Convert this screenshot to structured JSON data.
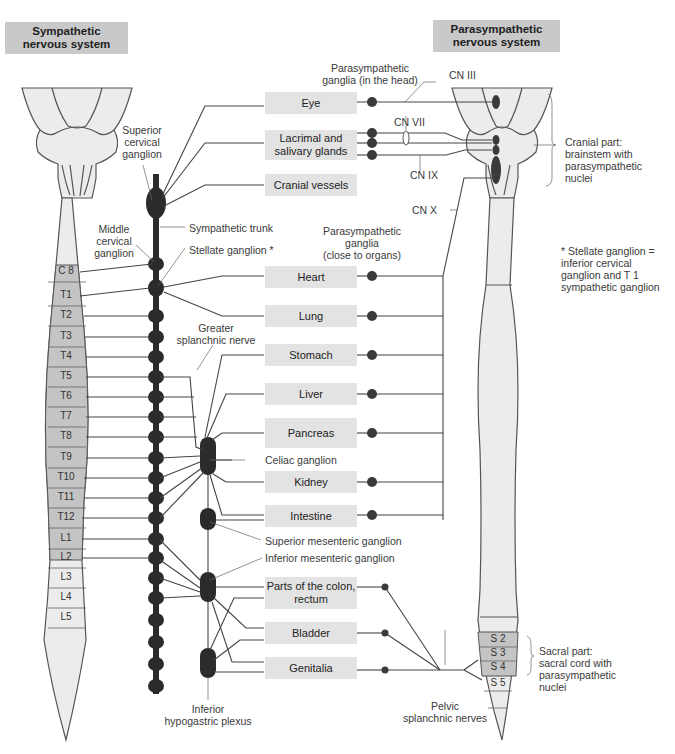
{
  "headers": {
    "sympathetic": [
      "Sympathetic",
      "nervous system"
    ],
    "parasympathetic": [
      "Parasympathetic",
      "nervous system"
    ]
  },
  "organs": [
    {
      "id": "eye",
      "lines": [
        "Eye"
      ]
    },
    {
      "id": "lacrimal",
      "lines": [
        "Lacrimal and",
        "salivary glands"
      ]
    },
    {
      "id": "cranial-vessels",
      "lines": [
        "Cranial vessels"
      ]
    },
    {
      "id": "heart",
      "lines": [
        "Heart"
      ]
    },
    {
      "id": "lung",
      "lines": [
        "Lung"
      ]
    },
    {
      "id": "stomach",
      "lines": [
        "Stomach"
      ]
    },
    {
      "id": "liver",
      "lines": [
        "Liver"
      ]
    },
    {
      "id": "pancreas",
      "lines": [
        "Pancreas"
      ]
    },
    {
      "id": "kidney",
      "lines": [
        "Kidney"
      ]
    },
    {
      "id": "intestine",
      "lines": [
        "Intestine"
      ]
    },
    {
      "id": "colon",
      "lines": [
        "Parts of the colon,",
        "rectum"
      ]
    },
    {
      "id": "bladder",
      "lines": [
        "Bladder"
      ]
    },
    {
      "id": "genitalia",
      "lines": [
        "Genitalia"
      ]
    }
  ],
  "spinal_segments_left": [
    "C 8",
    "T1",
    "T2",
    "T3",
    "T4",
    "T5",
    "T6",
    "T7",
    "T8",
    "T9",
    "T10",
    "T11",
    "T12",
    "L1",
    "L2",
    "L3",
    "L4",
    "L5"
  ],
  "spinal_segments_right": [
    "S 2",
    "S 3",
    "S 4",
    "S 5"
  ],
  "labels": {
    "superior_cervical": [
      "Superior",
      "cervical",
      "ganglion"
    ],
    "middle_cervical": [
      "Middle",
      "cervical",
      "ganglion"
    ],
    "sympathetic_trunk": "Sympathetic trunk",
    "stellate": "Stellate ganglion *",
    "greater_splanchnic": [
      "Greater",
      "splanchnic nerve"
    ],
    "celiac": "Celiac ganglion",
    "superior_mesenteric": "Superior mesenteric ganglion",
    "inferior_mesenteric": "Inferior mesenteric ganglion",
    "inferior_hypogastric": [
      "Inferior",
      "hypogastric plexus"
    ],
    "para_ganglia_head": [
      "Parasympathetic",
      "ganglia (in the head)"
    ],
    "para_ganglia_organs": [
      "Parasympathetic",
      "ganglia",
      "(close to organs)"
    ],
    "cn3": "CN III",
    "cn7": "CN VII",
    "cn9": "CN IX",
    "cn10": "CN X",
    "cranial_part": [
      "Cranial part:",
      "brainstem with",
      "parasympathetic",
      "nuclei"
    ],
    "stellate_note": [
      "* Stellate ganglion =",
      "inferior cervical",
      "ganglion and T 1",
      "sympathetic ganglion"
    ],
    "sacral_part": [
      "Sacral part:",
      "sacral cord with",
      "parasympathetic",
      "nuclei"
    ],
    "pelvic_splanchnic": [
      "Pelvic",
      "splanchnic nerves"
    ]
  },
  "colors": {
    "header_bg": "#c9c9c9",
    "box_bg": "#e3e3e3",
    "cord_fill": "#ececec",
    "segment_fill": "#c4c4c4",
    "ganglion": "#2b2b2b",
    "line": "#555555"
  }
}
